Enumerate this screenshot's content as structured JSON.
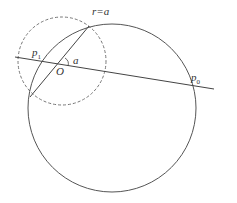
{
  "labels": {
    "circle_radius": "r=a",
    "p1": "p",
    "p1_sub": "1",
    "origin": "O",
    "angle": "a",
    "p0": "p",
    "p0_sub": "0"
  },
  "colors": {
    "stroke": "#555555",
    "dashed": "#777777"
  }
}
